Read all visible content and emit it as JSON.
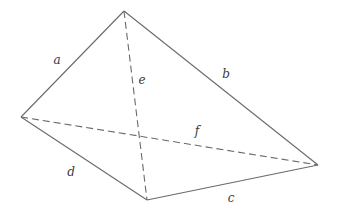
{
  "diagram": {
    "type": "tetrahedron",
    "vertices": {
      "top": {
        "x": 124,
        "y": 11
      },
      "left": {
        "x": 21,
        "y": 117
      },
      "bottom": {
        "x": 147,
        "y": 200
      },
      "right": {
        "x": 318,
        "y": 165
      }
    },
    "edges": [
      {
        "id": "a",
        "label": "a",
        "from": "left",
        "to": "top",
        "style": "solid",
        "label_x": 57,
        "label_y": 60
      },
      {
        "id": "b",
        "label": "b",
        "from": "top",
        "to": "right",
        "style": "solid",
        "label_x": 226,
        "label_y": 74
      },
      {
        "id": "c",
        "label": "c",
        "from": "bottom",
        "to": "right",
        "style": "solid",
        "label_x": 231,
        "label_y": 198
      },
      {
        "id": "d",
        "label": "d",
        "from": "left",
        "to": "bottom",
        "style": "solid",
        "label_x": 71,
        "label_y": 172
      },
      {
        "id": "e",
        "label": "e",
        "from": "top",
        "to": "bottom",
        "style": "dashed",
        "label_x": 142,
        "label_y": 80
      },
      {
        "id": "f",
        "label": "f",
        "from": "left",
        "to": "right",
        "style": "dashed",
        "label_x": 197,
        "label_y": 131
      }
    ],
    "line_color": "#6a6a6a",
    "label_color": "#3a3a3a"
  }
}
